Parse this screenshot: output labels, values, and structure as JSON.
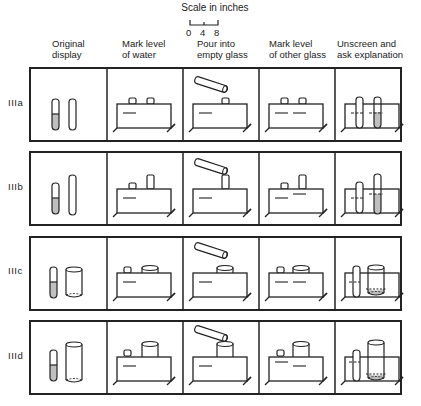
{
  "scale": {
    "title": "Scale in inches",
    "ticks": [
      "0",
      "4",
      "8"
    ]
  },
  "columns": [
    {
      "label_line1": "Original",
      "label_line2": "display"
    },
    {
      "label_line1": "Mark level",
      "label_line2": "of water"
    },
    {
      "label_line1": "Pour into",
      "label_line2": "empty glass"
    },
    {
      "label_line1": "Mark level",
      "label_line2": "of other glass"
    },
    {
      "label_line1": "Unscreen and",
      "label_line2": "ask explanation"
    }
  ],
  "rows": [
    {
      "label": "IIIa",
      "glass_a": "narrow short",
      "glass_b": "narrow short"
    },
    {
      "label": "IIIb",
      "glass_a": "narrow short",
      "glass_b": "narrow tall"
    },
    {
      "label": "IIIc",
      "glass_a": "narrow short",
      "glass_b": "wide short"
    },
    {
      "label": "IIId",
      "glass_a": "narrow short",
      "glass_b": "wide tall"
    }
  ],
  "colors": {
    "ink": "#222222",
    "water": "#bfbfbf",
    "background": "#ffffff"
  }
}
